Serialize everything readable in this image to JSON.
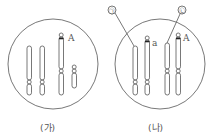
{
  "panels": [
    {
      "id": "ga",
      "label": "(가)",
      "gene_label": "A"
    },
    {
      "id": "na",
      "label": "(나)",
      "gene_labels": [
        "a",
        "A"
      ],
      "callouts": [
        "㉠",
        "㉡"
      ]
    }
  ],
  "colors": {
    "stroke": "#555555",
    "band": "#222222",
    "background": "#ffffff"
  }
}
